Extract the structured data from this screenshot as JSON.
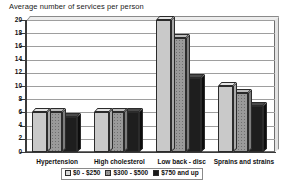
{
  "chart_data": {
    "type": "bar",
    "title": "Average number of services per person",
    "xlabel": "",
    "ylabel": "",
    "ylim": [
      0,
      20
    ],
    "ytick_step": 2,
    "yticks": [
      0,
      2,
      4,
      6,
      8,
      10,
      12,
      14,
      16,
      18,
      20
    ],
    "grid": true,
    "legend_position": "bottom",
    "style": "3d-grouped-column",
    "categories": [
      "Hypertension",
      "High cholesterol",
      "Low back - disc",
      "Sprains and strains"
    ],
    "series": [
      {
        "name": "$0 - $250",
        "color": "#c9c9c9",
        "values": [
          6.0,
          6.0,
          20.0,
          10.0
        ]
      },
      {
        "name": "$300 - $500",
        "color": "#9a9a9a",
        "values": [
          6.0,
          6.0,
          17.2,
          9.0
        ]
      },
      {
        "name": "$750 and up",
        "color": "#1e1e1e",
        "values": [
          5.3,
          6.0,
          11.2,
          7.0
        ]
      }
    ]
  }
}
